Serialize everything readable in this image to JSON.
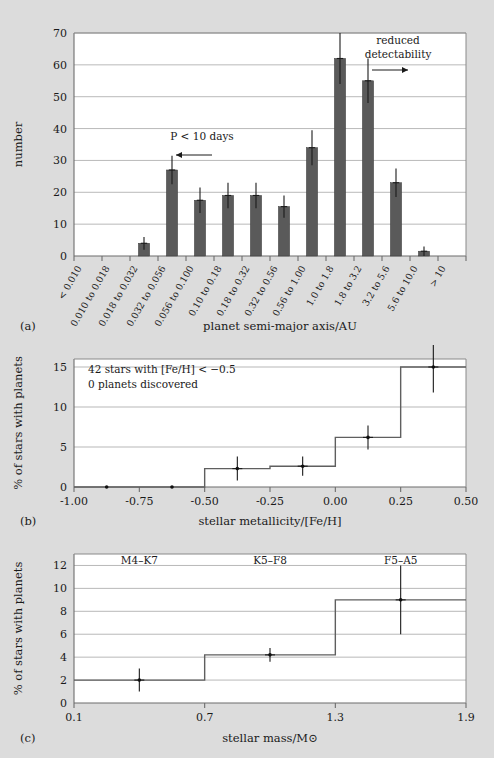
{
  "figure": {
    "background_color": "#dcdcdc",
    "bar_color": "#5a5a5a",
    "step_color": "#5f5f5f"
  },
  "panel_a": {
    "letter": "(a)",
    "xlabel": "planet semi-major axis/AU",
    "ylabel": "number",
    "annotation_period": "P < 10 days",
    "annotation_period_arrow": "left-arrow",
    "annotation_detect_line1": "reduced",
    "annotation_detect_line2": "detectability",
    "annotation_detect_arrow": "right-arrow",
    "chart_data": {
      "type": "bar",
      "title": "",
      "xlabel": "planet semi-major axis/AU",
      "ylabel": "number",
      "ylim": [
        0,
        70
      ],
      "yticks": [
        0,
        10,
        20,
        30,
        40,
        50,
        60,
        70
      ],
      "grid": true,
      "legend": "none",
      "categories": [
        "< 0.010",
        "0.010 to 0.018",
        "0.018 to 0.032",
        "0.032 to 0.056",
        "0.056 to 0.100",
        "0.10 to 0.18",
        "0.18 to 0.32",
        "0.32 to 0.56",
        "0.56 to 1.00",
        "1.0 to 1.8",
        "1.8 to 3.2",
        "3.2 to 5.6",
        "5.6 to 10.0",
        "> 10"
      ],
      "values": [
        0,
        0,
        4,
        27,
        17.5,
        19,
        19,
        15.5,
        34,
        62,
        55,
        23,
        1.5,
        0
      ],
      "errors": [
        0,
        0,
        2,
        4.5,
        4,
        4,
        4,
        3.5,
        5.5,
        8,
        7,
        4.5,
        1.5,
        0
      ]
    }
  },
  "panel_b": {
    "letter": "(b)",
    "xlabel": "stellar metallicity/[Fe/H]",
    "ylabel": "% of stars with planets",
    "note_line1": "42 stars with [Fe/H] < −0.5",
    "note_line2": "0 planets discovered",
    "chart_data": {
      "type": "line",
      "title": "",
      "xlabel": "stellar metallicity/[Fe/H]",
      "ylabel": "% of stars with planets",
      "xlim": [
        -1.0,
        0.5
      ],
      "ylim": [
        0,
        16
      ],
      "xticks": [
        -1.0,
        -0.75,
        -0.5,
        -0.25,
        0.0,
        0.25,
        0.5
      ],
      "xtick_labels": [
        "-1.00",
        "-0.75",
        "-0.50",
        "-0.25",
        "0.00",
        "0.25",
        "0.50"
      ],
      "yticks": [
        0,
        5,
        10,
        15
      ],
      "grid": true,
      "legend": "none",
      "step_edges": [
        -1.0,
        -0.5,
        -0.25,
        0.0,
        0.25,
        0.5
      ],
      "step_values": [
        0,
        2.3,
        2.6,
        6.2,
        15.0
      ],
      "points_x": [
        -0.875,
        -0.625,
        -0.375,
        -0.125,
        0.125,
        0.375
      ],
      "points_y": [
        0,
        0,
        2.3,
        2.6,
        6.2,
        15.0
      ],
      "points_yerr": [
        0,
        0,
        1.5,
        1.2,
        1.5,
        3.2
      ]
    }
  },
  "panel_c": {
    "letter": "(c)",
    "xlabel": "stellar mass/M⊙",
    "ylabel": "% of stars with planets",
    "class_label_1": "M4–K7",
    "class_label_2": "K5–F8",
    "class_label_3": "F5–A5",
    "chart_data": {
      "type": "line",
      "title": "",
      "xlabel": "stellar mass/M⊙",
      "ylabel": "% of stars with planets",
      "xlim": [
        0.1,
        1.9
      ],
      "ylim": [
        0,
        13
      ],
      "xticks": [
        0.1,
        0.7,
        1.3,
        1.9
      ],
      "xtick_labels": [
        "0.1",
        "0.7",
        "1.3",
        "1.9"
      ],
      "yticks": [
        0,
        2,
        4,
        6,
        8,
        10,
        12
      ],
      "grid": true,
      "legend": "none",
      "step_edges": [
        0.1,
        0.7,
        1.3,
        1.9
      ],
      "step_values": [
        2.0,
        4.2,
        9.0
      ],
      "points_x": [
        0.4,
        1.0,
        1.6
      ],
      "points_y": [
        2.0,
        4.2,
        9.0
      ],
      "points_yerr": [
        1.0,
        0.6,
        3.0
      ]
    }
  }
}
